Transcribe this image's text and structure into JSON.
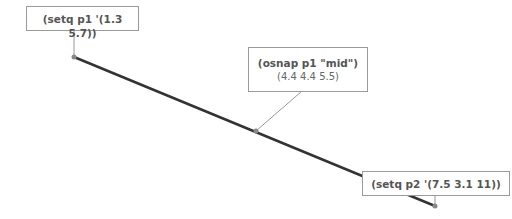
{
  "diagram": {
    "line": {
      "start": [
        74,
        57
      ],
      "end": [
        435,
        206
      ],
      "color": "#333333"
    },
    "labels": [
      {
        "id": "p1",
        "title": "(setq p1 '(1.3 5.7))",
        "anchor": [
          74,
          57
        ]
      },
      {
        "id": "mid",
        "title": "(osnap p1 \"mid\")",
        "subtitle": "(4.4 4.4 5.5)",
        "anchor": [
          256,
          131
        ]
      },
      {
        "id": "p2",
        "title": "(setq p2 '(7.5 3.1 11))",
        "anchor": [
          435,
          206
        ]
      }
    ]
  }
}
